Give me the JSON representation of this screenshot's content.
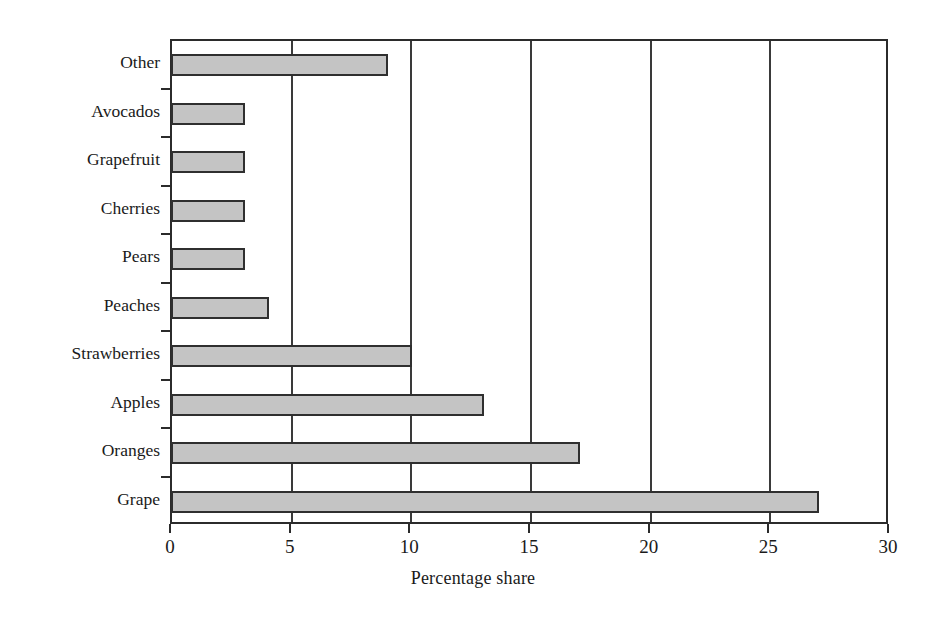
{
  "chart_data": {
    "type": "bar",
    "orientation": "horizontal",
    "title": "",
    "xlabel": "Percentage share",
    "ylabel": "",
    "xlim": [
      0,
      30
    ],
    "xticks": [
      0,
      5,
      10,
      15,
      20,
      25,
      30
    ],
    "grid": "vertical",
    "legend": "none",
    "categories": [
      "Other",
      "Avocados",
      "Grapefruit",
      "Cherries",
      "Pears",
      "Peaches",
      "Strawberries",
      "Apples",
      "Oranges",
      "Grape"
    ],
    "values": [
      9,
      3,
      3,
      3,
      3,
      4,
      10,
      13,
      17,
      27
    ],
    "bar_fill_color": "#c4c4c4",
    "bar_edge_color": "#2f2f2f",
    "axis_color": "#2b2b2b"
  }
}
